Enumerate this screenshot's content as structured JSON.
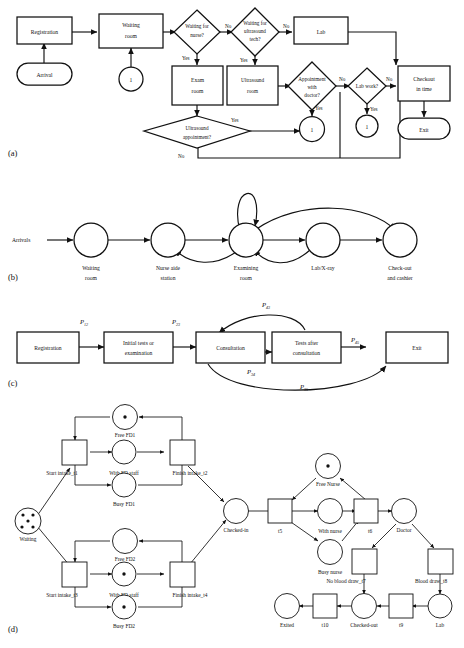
{
  "figure": {
    "panels": [
      {
        "id": "a",
        "label": "(a)",
        "type": "flowchart"
      },
      {
        "id": "b",
        "label": "(b)",
        "type": "queueing-network"
      },
      {
        "id": "c",
        "label": "(c)",
        "type": "markov-chain"
      },
      {
        "id": "d",
        "label": "(d)",
        "type": "petri-net"
      }
    ]
  },
  "panel_a": {
    "label": "(a)",
    "nodes": {
      "registration": "Registration",
      "waiting_room_l1": "Waiting",
      "waiting_room_l2": "room",
      "arrival": "Arrival",
      "resource_waiting": "1",
      "waiting_for_nurse_l1": "Waiting for",
      "waiting_for_nurse_l2": "nurse?",
      "waiting_for_us_l1": "Waiting for",
      "waiting_for_us_l2": "ultrasound",
      "waiting_for_us_l3": "tech?",
      "lab": "Lab",
      "exam_room_l1": "Exam",
      "exam_room_l2": "room",
      "ultrasound_room_l1": "Ultrasound",
      "ultrasound_room_l2": "room",
      "appointment_l1": "Appointment",
      "appointment_l2": "with",
      "appointment_l3": "doctor?",
      "lab_work": "Lab work?",
      "checkout_l1": "Checkout",
      "checkout_l2": "in time",
      "exit": "Exit",
      "us_appt_l1": "Ultrasound",
      "us_appt_l2": "appointment?",
      "resource_doctor": "1",
      "resource_lab": "1"
    },
    "edge_labels": {
      "nurse_no": "No",
      "nurse_yes": "Yes",
      "us_no": "No",
      "us_yes": "Yes",
      "appt_no": "No",
      "appt_yes": "Yes",
      "labwork_no": "No",
      "labwork_yes": "Yes",
      "usappt_yes": "Yes",
      "usappt_no": "No"
    }
  },
  "panel_b": {
    "label": "(b)",
    "source": "Arrivals",
    "nodes": [
      {
        "l1": "Waiting",
        "l2": "room"
      },
      {
        "l1": "Nurse aide",
        "l2": "station"
      },
      {
        "l1": "Examining",
        "l2": "room"
      },
      {
        "l1": "Lab/X-ray",
        "l2": ""
      },
      {
        "l1": "Check-out",
        "l2": "and cashier"
      }
    ]
  },
  "panel_c": {
    "label": "(c)",
    "nodes": [
      {
        "l1": "Registration",
        "l2": ""
      },
      {
        "l1": "Initial tests or",
        "l2": "examination"
      },
      {
        "l1": "Consultation",
        "l2": ""
      },
      {
        "l1": "Tests after",
        "l2": "consultation"
      },
      {
        "l1": "Exit",
        "l2": ""
      }
    ],
    "transitions": [
      {
        "base": "P",
        "sub": "12"
      },
      {
        "base": "P",
        "sub": "23"
      },
      {
        "base": "P",
        "sub": "43"
      },
      {
        "base": "P",
        "sub": "34"
      },
      {
        "base": "P",
        "sub": "45"
      },
      {
        "base": "P",
        "sub": "35"
      }
    ]
  },
  "panel_d": {
    "label": "(d)",
    "places": [
      {
        "name": "Waiting",
        "tokens": 5
      },
      {
        "name": "Free FD1",
        "tokens": 1
      },
      {
        "name": "With FD staff",
        "tokens": 0
      },
      {
        "name": "Busy FD1",
        "tokens": 0
      },
      {
        "name": "Free FD2",
        "tokens": 0
      },
      {
        "name": "With FD staff",
        "tokens": 1
      },
      {
        "name": "Busy FD2",
        "tokens": 1
      },
      {
        "name": "Checked-in",
        "tokens": 0
      },
      {
        "name": "Free Nurse",
        "tokens": 1
      },
      {
        "name": "With nurse",
        "tokens": 0
      },
      {
        "name": "Busy nurse",
        "tokens": 0
      },
      {
        "name": "Doctor",
        "tokens": 0
      },
      {
        "name": "Lab",
        "tokens": 0
      },
      {
        "name": "Checked-out",
        "tokens": 0
      },
      {
        "name": "Exited",
        "tokens": 0
      }
    ],
    "transitions": [
      {
        "name": "Start intake_t1"
      },
      {
        "name": "Finish intake_t2"
      },
      {
        "name": "Start intake_t3"
      },
      {
        "name": "Finish intake_t4"
      },
      {
        "name": "t5"
      },
      {
        "name": "t6"
      },
      {
        "name": "No blood draw_t7"
      },
      {
        "name": "Blood draw_t8"
      },
      {
        "name": "t9"
      },
      {
        "name": "t10"
      }
    ]
  },
  "colors": {
    "stroke": "#111111",
    "fill": "#ffffff",
    "background": "#ffffff"
  }
}
